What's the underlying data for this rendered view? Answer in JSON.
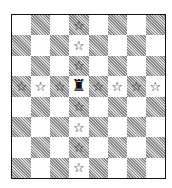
{
  "diagram": {
    "type": "chessboard",
    "files": [
      "a",
      "b",
      "c",
      "d",
      "e",
      "f",
      "g",
      "h"
    ],
    "ranks": [
      8,
      7,
      6,
      5,
      4,
      3,
      2,
      1
    ],
    "top_left_square_color": "light",
    "piece": {
      "name": "rook",
      "color": "white",
      "square": "d5",
      "glyph": "♜"
    },
    "marker": {
      "name": "star",
      "glyph": "☆"
    },
    "marked_squares": [
      "d8",
      "d7",
      "d6",
      "a5",
      "b5",
      "c5",
      "e5",
      "f5",
      "g5",
      "h5",
      "d4",
      "d3",
      "d2",
      "d1"
    ],
    "colors": {
      "light": "#ffffff",
      "dark_hatch": "#8a8a8a",
      "border": "#111111"
    }
  }
}
